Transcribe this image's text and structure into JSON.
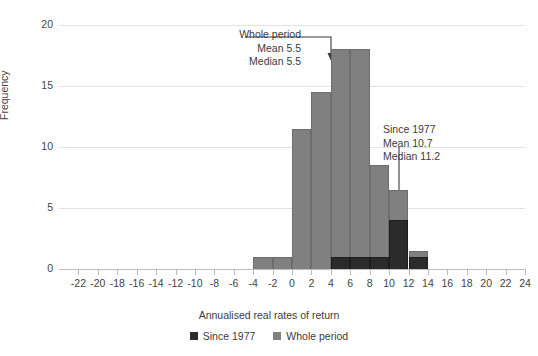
{
  "chart_data": {
    "type": "bar",
    "title": "",
    "subtitle": "",
    "xlabel": "Annualised real rates of return",
    "ylabel": "Frequency",
    "xlim": [
      -24,
      24
    ],
    "ylim": [
      0,
      20
    ],
    "xticks": [
      -22,
      -20,
      -18,
      -16,
      -14,
      -12,
      -10,
      -8,
      -6,
      -4,
      -2,
      0,
      2,
      4,
      6,
      8,
      10,
      12,
      14,
      16,
      18,
      20,
      22,
      24
    ],
    "xtick_labels": [
      "-22",
      "-20",
      "-18",
      "-16",
      "-14",
      "-12",
      "-10",
      "-8",
      "-6",
      "-4",
      "-2",
      "0",
      "2",
      "4",
      "6",
      "8",
      "10",
      "12",
      "14",
      "16",
      "18",
      "20",
      "22",
      "24"
    ],
    "yticks": [
      0,
      5,
      10,
      15,
      20
    ],
    "ytick_labels": [
      "0",
      "5",
      "10",
      "15",
      "20"
    ],
    "grid": "horizontal",
    "bin_width": 2,
    "bin_starts": [
      -4,
      -2,
      0,
      2,
      4,
      6,
      8,
      10,
      12
    ],
    "bin_labels": [
      "-4 to -2",
      "-2 to 0",
      "0 to 2",
      "2 to 4",
      "4 to 6",
      "6 to 8",
      "8 to 10",
      "10 to 12",
      "12 to 14"
    ],
    "legend_position": "bottom-center",
    "series": [
      {
        "name": "Since 1977",
        "color": "#2b2b2b",
        "values": [
          0,
          0,
          0,
          0,
          1,
          1,
          1,
          4,
          1
        ]
      },
      {
        "name": "Whole period",
        "color": "#808080",
        "values": [
          1,
          1,
          11.5,
          14.5,
          18,
          18,
          8.5,
          6.5,
          1.5
        ]
      }
    ],
    "annotations": [
      {
        "id": "whole-period",
        "lines": [
          "Whole period",
          "Mean 5.5",
          "Median 5.5"
        ],
        "points_to_bin": "4 to 6",
        "arrow": "elbow-down"
      },
      {
        "id": "since-1977",
        "lines": [
          "Since 1977",
          "Mean 10.7",
          "Median 11.2"
        ],
        "points_to_bin": "10 to 12",
        "arrow": "vertical-down"
      }
    ]
  },
  "legend": {
    "items": [
      {
        "label": "Since 1977",
        "color": "#2b2b2b"
      },
      {
        "label": "Whole period",
        "color": "#808080"
      }
    ]
  },
  "annotation_whole": {
    "line1": "Whole period",
    "line2": "Mean 5.5",
    "line3": "Median 5.5"
  },
  "annotation_since": {
    "line1": "Since 1977",
    "line2": "Mean 10.7",
    "line3": "Median 11.2"
  },
  "axes": {
    "x_title": "Annualised real rates of return",
    "y_title": "Frequency"
  }
}
